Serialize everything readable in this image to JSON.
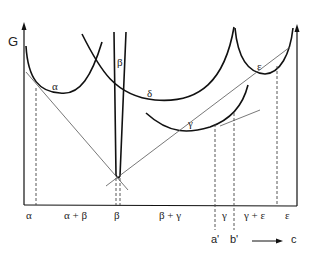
{
  "diagram": {
    "y_axis_label": "G",
    "curve_labels": {
      "alpha": "α",
      "beta": "β",
      "delta": "δ",
      "gamma": "γ",
      "epsilon": "ε"
    },
    "x_regions": [
      {
        "label": "α"
      },
      {
        "label": "α + β"
      },
      {
        "label": "β"
      },
      {
        "label": "β + γ"
      },
      {
        "label": "γ"
      },
      {
        "label": "γ + ε"
      },
      {
        "label": "ε"
      }
    ],
    "x_markers": {
      "a_prime": "a'",
      "b_prime": "b'",
      "composition": "c"
    },
    "colors": {
      "curve": "#111111",
      "tangent": "#555555",
      "dashed": "#444444"
    }
  }
}
